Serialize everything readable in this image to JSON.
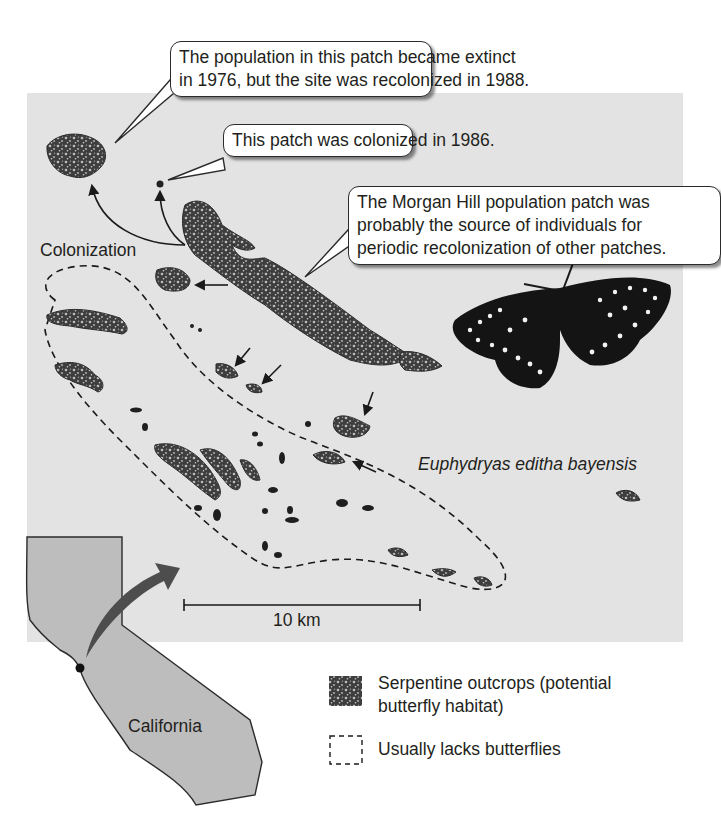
{
  "figure": {
    "callouts": {
      "extinct": {
        "line1": "The population in this patch became extinct",
        "line2": "in 1976, but the site was recolonized in 1988."
      },
      "colonized": {
        "text": "This patch was colonized in 1986."
      },
      "morgan_hill": {
        "line1": "The Morgan Hill population patch was",
        "line2": "probably the source of individuals for",
        "line3": "periodic recolonization of other patches."
      }
    },
    "labels": {
      "colonization": "Colonization",
      "species": "Euphydryas editha bayensis",
      "scale_bar": "10 km",
      "state": "California"
    },
    "legend": {
      "items": [
        {
          "symbol": "serpentine-pattern",
          "line1": "Serpentine outcrops (potential",
          "line2": "butterfly habitat)"
        },
        {
          "symbol": "dashed-box",
          "line1": "Usually lacks butterflies"
        }
      ]
    },
    "colors": {
      "panel_bg": "#e3e3e3",
      "patch_fill": "#4a4a4a",
      "california_fill": "#bdbdbd",
      "locator_arrow": "#4d4d4d",
      "ink": "#231f20"
    }
  }
}
